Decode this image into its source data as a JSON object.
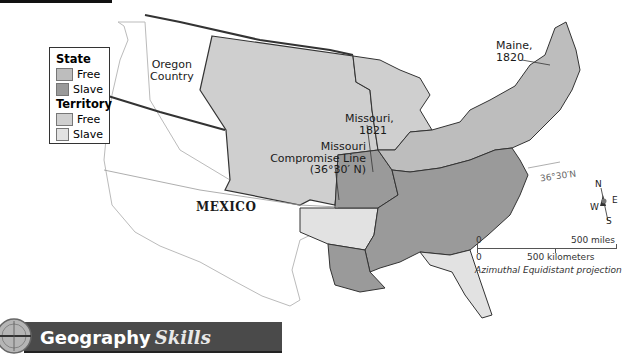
{
  "map": {
    "title": "Missouri Compromise, 1820",
    "labels": {
      "oregon": "Oregon Country",
      "oregon_line1": "Oregon",
      "oregon_line2": "Country",
      "missouri_line1": "Missouri,",
      "missouri_line2": "1821",
      "compromise_line1": "Missouri",
      "compromise_line2": "Compromise Line",
      "compromise_line3": "(36°30′ N)",
      "maine_line1": "Maine,",
      "maine_line2": "1820",
      "mexico": "MEXICO",
      "latitude": "36°30′N"
    },
    "legend": {
      "state_heading": "State",
      "state_items": [
        {
          "label": "Free",
          "color": "#bdbdbd"
        },
        {
          "label": "Slave",
          "color": "#9a9a9a"
        }
      ],
      "territory_heading": "Territory",
      "territory_items": [
        {
          "label": "Free",
          "color": "#cfcfcf"
        },
        {
          "label": "Slave",
          "color": "#e2e2e2"
        }
      ]
    },
    "compass": {
      "n": "N",
      "s": "S",
      "e": "E",
      "w": "W"
    },
    "scale": {
      "miles_zero": "0",
      "miles_label": "500 miles",
      "km_zero": "0",
      "km_label": "500 kilometers",
      "projection": "Azimuthal Equidistant projection"
    },
    "colors": {
      "free_state": "#bdbdbd",
      "slave_state": "#9a9a9a",
      "free_territory": "#cfcfcf",
      "slave_territory": "#e2e2e2",
      "foreign": "#ffffff",
      "border": "#333333"
    }
  },
  "banner": {
    "title": "Geography",
    "title_italic": "Skills"
  }
}
